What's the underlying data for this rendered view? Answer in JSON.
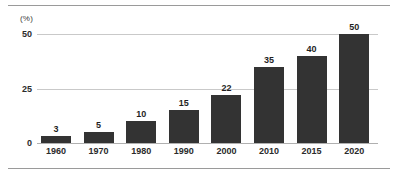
{
  "chart_data": {
    "type": "bar",
    "title": "",
    "subtitle": "",
    "xlabel": "",
    "ylabel": "(%)",
    "unit_label": "(%)",
    "categories": [
      "1960",
      "1970",
      "1980",
      "1990",
      "2000",
      "2010",
      "2015",
      "2020"
    ],
    "values": [
      3,
      5,
      10,
      15,
      22,
      35,
      40,
      50
    ],
    "data_labels": [
      "3",
      "5",
      "10",
      "15",
      "22",
      "35",
      "40",
      "50"
    ],
    "ylim": [
      0,
      50
    ],
    "yticks": [
      0,
      25,
      50
    ],
    "ytick_labels": [
      "0",
      "25",
      "50"
    ],
    "grid": true,
    "grid_axis": "y",
    "legend": false,
    "legend_position": "none",
    "series": [
      {
        "name": "",
        "values": [
          3,
          5,
          10,
          15,
          22,
          35,
          40,
          50
        ],
        "color": "#333333"
      }
    ],
    "colors": {
      "bar": "#333333",
      "gridline": "#c9c9c9",
      "baseline": "#b0b0b0",
      "rule": "#9a9a9a",
      "text": "#2b2b2b",
      "background": "#ffffff"
    }
  }
}
